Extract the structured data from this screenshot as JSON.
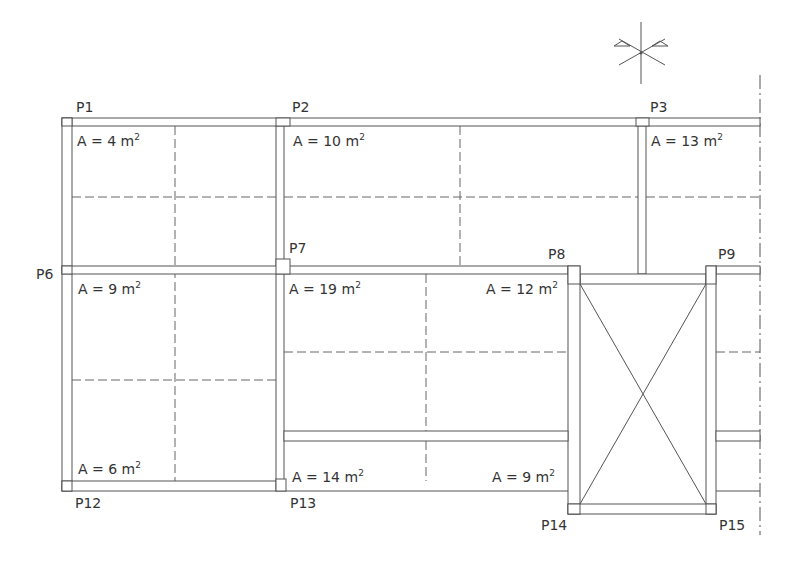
{
  "drawing": {
    "type": "structural-floor-plan",
    "colors": {
      "line": "#555555",
      "text": "#333333",
      "background": "#ffffff"
    }
  },
  "north_symbol": {
    "icon": "north-arrow-icon"
  },
  "columns": [
    {
      "id": "P1",
      "label": "P1"
    },
    {
      "id": "P2",
      "label": "P2"
    },
    {
      "id": "P3",
      "label": "P3"
    },
    {
      "id": "P6",
      "label": "P6"
    },
    {
      "id": "P7",
      "label": "P7"
    },
    {
      "id": "P8",
      "label": "P8"
    },
    {
      "id": "P9",
      "label": "P9"
    },
    {
      "id": "P12",
      "label": "P12"
    },
    {
      "id": "P13",
      "label": "P13"
    },
    {
      "id": "P14",
      "label": "P14"
    },
    {
      "id": "P15",
      "label": "P15"
    }
  ],
  "areas": [
    {
      "panel": "P1-P2-P6-P7",
      "prefix": "A = 4 m",
      "exp": "2"
    },
    {
      "panel": "P2-P3-P7-P8",
      "prefix": "A = 10 m",
      "exp": "2"
    },
    {
      "panel": "P3-right",
      "prefix": "A = 13 m",
      "exp": "2"
    },
    {
      "panel": "P6-P7-top",
      "prefix": "A = 9 m",
      "exp": "2"
    },
    {
      "panel": "P7-P8-left",
      "prefix": "A = 19 m",
      "exp": "2"
    },
    {
      "panel": "P7-P8-right",
      "prefix": "A = 12 m",
      "exp": "2"
    },
    {
      "panel": "P12-P13",
      "prefix": "A = 6 m",
      "exp": "2"
    },
    {
      "panel": "P13-P14-left",
      "prefix": "A = 14 m",
      "exp": "2"
    },
    {
      "panel": "P13-P14-right",
      "prefix": "A = 9 m",
      "exp": "2"
    }
  ],
  "openings": [
    {
      "name": "stair-void",
      "between": [
        "P8",
        "P9",
        "P14",
        "P15"
      ],
      "marker": "X"
    }
  ]
}
